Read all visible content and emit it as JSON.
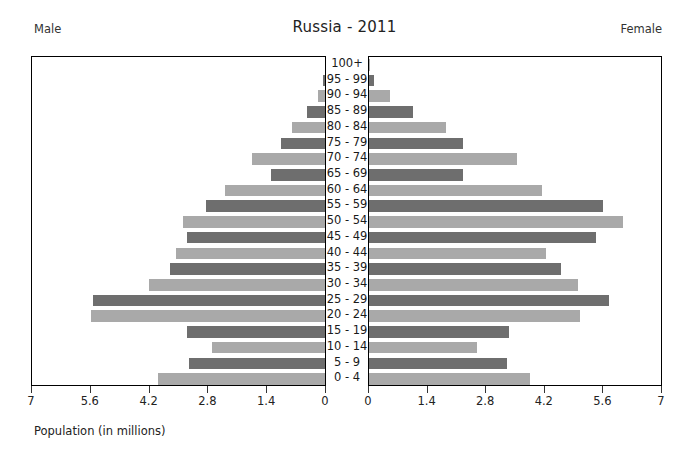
{
  "header": {
    "title": "Russia - 2011",
    "left_label": "Male",
    "right_label": "Female"
  },
  "axis_caption": "Population (in millions)",
  "chart_data": {
    "type": "bar",
    "subtype": "population-pyramid",
    "title": "Russia - 2011",
    "xlabel": "Population (in millions)",
    "ylabel": "",
    "grid": false,
    "legend_position": "top-outside",
    "xlim": [
      0,
      7
    ],
    "left_ticks": [
      "7",
      "5.6",
      "4.2",
      "2.8",
      "1.4",
      "0"
    ],
    "right_ticks": [
      "0",
      "1.4",
      "2.8",
      "4.2",
      "5.6",
      "7"
    ],
    "tick_values": [
      0,
      1.4,
      2.8,
      4.2,
      5.6,
      7
    ],
    "categories": [
      "100+",
      "95 - 99",
      "90 - 94",
      "85 - 89",
      "80 - 84",
      "75 - 79",
      "70 - 74",
      "65 - 69",
      "60 - 64",
      "55 - 59",
      "50 - 54",
      "45 - 49",
      "40 - 44",
      "35 - 39",
      "30 - 34",
      "25 - 29",
      "20 - 24",
      "15 - 19",
      "10 - 14",
      "5 - 9",
      "0 - 4"
    ],
    "series": [
      {
        "name": "Male",
        "side": "left",
        "color": "#6e6e6e",
        "alt_color": "#a9a9a9",
        "values": [
          0.01,
          0.05,
          0.17,
          0.42,
          0.78,
          1.05,
          1.75,
          1.3,
          2.4,
          2.85,
          3.4,
          3.3,
          3.55,
          3.7,
          4.2,
          5.55,
          5.6,
          3.3,
          2.7,
          3.25,
          4.0
        ]
      },
      {
        "name": "Female",
        "side": "right",
        "color": "#6e6e6e",
        "alt_color": "#a9a9a9",
        "values": [
          0.02,
          0.13,
          0.5,
          1.05,
          1.85,
          2.25,
          3.55,
          2.25,
          4.15,
          5.6,
          6.1,
          5.45,
          4.25,
          4.6,
          5.0,
          5.75,
          5.05,
          3.35,
          2.6,
          3.3,
          3.85
        ]
      }
    ]
  },
  "colors": {
    "bar_dark": "#6e6e6e",
    "bar_light": "#a9a9a9",
    "frame": "#000000",
    "text": "#222222",
    "background": "#ffffff"
  }
}
